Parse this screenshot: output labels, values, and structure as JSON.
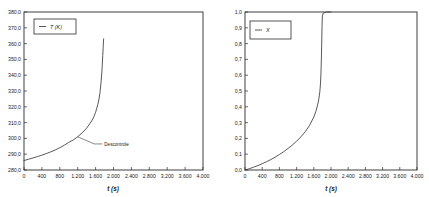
{
  "figure": {
    "background_color": "#ffffff",
    "curve_color": "#3a3a3a",
    "axis_color": "#2b2b2b"
  },
  "chart_data": [
    {
      "type": "line",
      "panel": "left",
      "title": "",
      "xlabel": "t (s)",
      "ylabel": "",
      "legend": [
        {
          "name": "T (K)",
          "marker": "line"
        }
      ],
      "legend_position": "top-left",
      "grid": false,
      "xlim": [
        0,
        4000
      ],
      "ylim": [
        280.0,
        380.0
      ],
      "xticks": [
        0,
        400,
        800,
        1200,
        1600,
        2000,
        2400,
        2800,
        3200,
        3600,
        4000
      ],
      "xticklabels": [
        "0",
        "400",
        "800",
        "1.200",
        "1.600",
        "2.000",
        "2.400",
        "2.800",
        "3.200",
        "3.600",
        "4.000"
      ],
      "yticks": [
        280.0,
        290.0,
        300.0,
        310.0,
        320.0,
        330.0,
        340.0,
        350.0,
        360.0,
        370.0,
        380.0
      ],
      "yticklabels": [
        "280,0",
        "290,0",
        "300,0",
        "310,0",
        "320,0",
        "330,0",
        "340,0",
        "350,0",
        "360,0",
        "370,0",
        "380,0"
      ],
      "series": [
        {
          "name": "T (K)",
          "x": [
            0,
            100,
            200,
            300,
            400,
            500,
            600,
            700,
            800,
            900,
            1000,
            1100,
            1200,
            1300,
            1400,
            1500,
            1550,
            1600,
            1650,
            1680,
            1700,
            1720,
            1740,
            1750,
            1760,
            1770,
            1775,
            1780
          ],
          "y": [
            286.0,
            286.8,
            287.6,
            288.5,
            289.4,
            290.4,
            291.5,
            292.7,
            294.1,
            295.7,
            297.5,
            299.0,
            301.0,
            303.5,
            306.5,
            310.5,
            313.0,
            316.5,
            321.5,
            325.5,
            329.5,
            335.0,
            342.0,
            347.0,
            352.5,
            358.0,
            361.0,
            363.0
          ]
        }
      ],
      "annotations": [
        {
          "text": "Descontrole",
          "x": 1200,
          "y": 301.0,
          "label_x": 1750,
          "label_y": 296.5
        }
      ]
    },
    {
      "type": "line",
      "panel": "right",
      "title": "",
      "xlabel": "t (s)",
      "ylabel": "",
      "legend": [
        {
          "name": "X",
          "marker": "line"
        }
      ],
      "legend_position": "top-left",
      "grid": false,
      "xlim": [
        0,
        4000
      ],
      "ylim": [
        0.0,
        1.0
      ],
      "xticks": [
        0,
        400,
        800,
        1200,
        1600,
        2000,
        2400,
        2800,
        3200,
        3600,
        4000
      ],
      "xticklabels": [
        "0",
        "400",
        "800",
        "1.200",
        "1.600",
        "2.000",
        "2.400",
        "2.800",
        "3.200",
        "3.600",
        "4.000"
      ],
      "yticks": [
        0.0,
        0.1,
        0.2,
        0.3,
        0.4,
        0.5,
        0.6,
        0.7,
        0.8,
        0.9,
        1.0
      ],
      "yticklabels": [
        "0,0",
        "0,1",
        "0,2",
        "0,3",
        "0,4",
        "0,5",
        "0,6",
        "0,7",
        "0,8",
        "0,9",
        "1,0"
      ],
      "series": [
        {
          "name": "X",
          "x": [
            0,
            100,
            200,
            300,
            400,
            500,
            600,
            700,
            800,
            900,
            1000,
            1100,
            1200,
            1300,
            1400,
            1500,
            1600,
            1650,
            1700,
            1720,
            1740,
            1755,
            1765,
            1775,
            1782,
            1788,
            1792,
            1796,
            1800,
            1820,
            1900,
            2000
          ],
          "y": [
            0.0,
            0.008,
            0.018,
            0.028,
            0.04,
            0.052,
            0.066,
            0.081,
            0.098,
            0.116,
            0.136,
            0.158,
            0.182,
            0.21,
            0.242,
            0.282,
            0.335,
            0.372,
            0.425,
            0.455,
            0.495,
            0.545,
            0.6,
            0.69,
            0.78,
            0.86,
            0.91,
            0.95,
            0.975,
            0.993,
            1.0,
            1.0
          ]
        }
      ],
      "annotations": []
    }
  ]
}
